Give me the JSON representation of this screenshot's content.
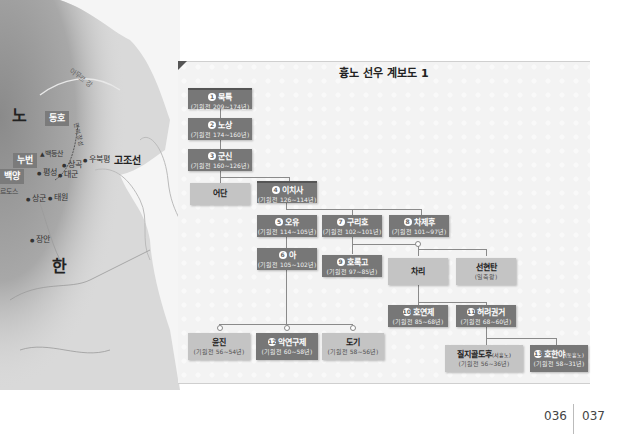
{
  "map": {
    "regions": [
      {
        "id": "xiongnu",
        "label": "노"
      },
      {
        "id": "han",
        "label": "한"
      },
      {
        "id": "gojoseon",
        "label": "고조선"
      }
    ],
    "chips": [
      {
        "id": "donghu",
        "label": "동호"
      },
      {
        "id": "nubeon",
        "label": "누번"
      },
      {
        "id": "baekyang",
        "label": "백양"
      }
    ],
    "places": [
      {
        "id": "baekdeungsan",
        "label": "백등산"
      },
      {
        "id": "pyeongseong",
        "label": "평성"
      },
      {
        "id": "sanggok",
        "label": "상곡"
      },
      {
        "id": "daegun",
        "label": "대군"
      },
      {
        "id": "ubukpyeong",
        "label": "우북평"
      },
      {
        "id": "sanggun",
        "label": "상군"
      },
      {
        "id": "taewon",
        "label": "태원"
      },
      {
        "id": "jangan",
        "label": "장안"
      },
      {
        "id": "ordos",
        "label": "르도스"
      },
      {
        "id": "river",
        "label": "아무르 강"
      },
      {
        "id": "wall",
        "label": "만리장성"
      }
    ]
  },
  "chart": {
    "title": "흉노 선우 계보도 1",
    "nodes": [
      {
        "id": "n1",
        "num": "1",
        "name": "묵특",
        "years": "(기원전 209~174년)"
      },
      {
        "id": "n2",
        "num": "2",
        "name": "노상",
        "years": "(기원전 174~160년)"
      },
      {
        "id": "n3",
        "num": "3",
        "name": "군신",
        "years": "(기원전 160~126년)"
      },
      {
        "id": "idan",
        "name": "어단"
      },
      {
        "id": "n4",
        "num": "4",
        "name": "이치사",
        "years": "(기원전 126~114년)"
      },
      {
        "id": "n5",
        "num": "5",
        "name": "오유",
        "years": "(기원전 114~105년)"
      },
      {
        "id": "n7",
        "num": "7",
        "name": "구리호",
        "years": "(기원전 102~101년)"
      },
      {
        "id": "n8",
        "num": "8",
        "name": "차제후",
        "years": "(기원전 101~97년)"
      },
      {
        "id": "n6",
        "num": "6",
        "name": "아",
        "years": "(기원전 105~102년)"
      },
      {
        "id": "n9",
        "num": "9",
        "name": "호록고",
        "years": "(기원전 97~85년)"
      },
      {
        "id": "chari",
        "name": "차리"
      },
      {
        "id": "seonhyeon",
        "name": "선현탄",
        "years": "(일축왕)"
      },
      {
        "id": "n10",
        "num": "10",
        "name": "호연제",
        "years": "(기원전 85~68년)"
      },
      {
        "id": "n11",
        "num": "11",
        "name": "허려권거",
        "years": "(기원전 68~60년)"
      },
      {
        "id": "yunjin",
        "name": "윤진",
        "years": "(기원전 56~54년)"
      },
      {
        "id": "n12",
        "num": "12",
        "name": "악연구제",
        "years": "(기원전 60~58년)"
      },
      {
        "id": "dogi",
        "name": "도기",
        "years": "(기원전 58~56년)"
      },
      {
        "id": "jiji",
        "name": "질지골도후",
        "suffix": "(서흉노)",
        "years": "(기원전 56~36년)"
      },
      {
        "id": "n13",
        "num": "13",
        "name": "호한야",
        "suffix": "(동흉노)",
        "years": "(기원전 58~31년)"
      }
    ]
  },
  "footer": {
    "page_left": "036",
    "page_right": "037"
  }
}
